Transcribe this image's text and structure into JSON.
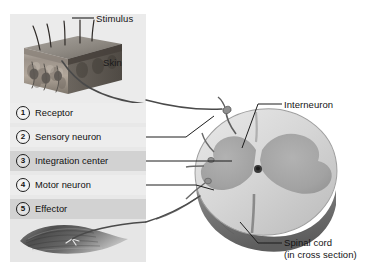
{
  "figure": {
    "type": "biology-diagram"
  },
  "skin_panel": {
    "stimulus_label": "Stimulus",
    "skin_label": "Skin",
    "illustration_name": "skin-cross-section-block"
  },
  "steps": [
    {
      "number": "1",
      "label": "Receptor"
    },
    {
      "number": "2",
      "label": "Sensory neuron"
    },
    {
      "number": "3",
      "label": "Integration center"
    },
    {
      "number": "4",
      "label": "Motor neuron"
    },
    {
      "number": "5",
      "label": "Effector"
    }
  ],
  "effector": {
    "illustration_name": "skeletal-muscle"
  },
  "right_labels": {
    "interneuron": "Interneuron",
    "spinal_cord_line1": "Spinal cord",
    "spinal_cord_line2": "(in cross section)"
  },
  "colors": {
    "panel_light": "#ededed",
    "panel_dark": "#d2d2d2",
    "white_matter": "#d9d9d9",
    "gray_matter": "#a8a8a8",
    "cord_rim": "#8c8c8c",
    "leader_line": "#2b2b2b",
    "nerve": "#6b6b6b",
    "text": "#141414"
  }
}
